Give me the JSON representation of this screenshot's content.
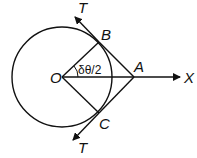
{
  "diagram": {
    "labels": {
      "O": "O",
      "A": "A",
      "B": "B",
      "C": "C",
      "X": "X",
      "T_top": "T",
      "T_bottom": "T",
      "angle": "δθ/2"
    },
    "colors": {
      "stroke": "#111111",
      "background": "#ffffff"
    }
  }
}
